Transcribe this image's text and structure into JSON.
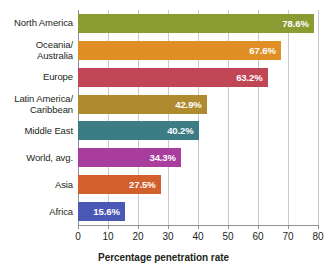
{
  "chart_data": {
    "type": "bar",
    "orientation": "horizontal",
    "title": "",
    "xlabel": "Percentage penetration rate",
    "ylabel": "",
    "xlim": [
      0,
      80
    ],
    "xticks": [
      0,
      10,
      20,
      30,
      40,
      50,
      60,
      70,
      80
    ],
    "xtick_labels": [
      "0",
      "10",
      "20",
      "30",
      "40",
      "50",
      "60",
      "70",
      "80"
    ],
    "grid": "vertical",
    "legend": "none",
    "value_label_suffix": "%",
    "categories": [
      "North America",
      "Oceania/\nAustralia",
      "Europe",
      "Latin America/\nCaribbean",
      "Middle East",
      "World, avg.",
      "Asia",
      "Africa"
    ],
    "values": [
      78.6,
      67.6,
      63.2,
      42.9,
      40.2,
      34.3,
      27.5,
      15.6
    ],
    "value_labels": [
      "78.6%",
      "67.6%",
      "63.2%",
      "42.9%",
      "40.2%",
      "34.3%",
      "27.5%",
      "15.6%"
    ],
    "colors": [
      "#8a9b32",
      "#df8f23",
      "#c04656",
      "#b08a2e",
      "#3c7d85",
      "#a93d9e",
      "#d1602c",
      "#4b58b5"
    ],
    "bars": [
      {
        "label": "North America",
        "label_lines": [
          "North America"
        ],
        "value": 78.6,
        "value_label": "78.6%",
        "color": "#8a9b32"
      },
      {
        "label": "Oceania/ Australia",
        "label_lines": [
          "Oceania/",
          "Australia"
        ],
        "value": 67.6,
        "value_label": "67.6%",
        "color": "#df8f23"
      },
      {
        "label": "Europe",
        "label_lines": [
          "Europe"
        ],
        "value": 63.2,
        "value_label": "63.2%",
        "color": "#c04656"
      },
      {
        "label": "Latin America/ Caribbean",
        "label_lines": [
          "Latin America/",
          "Caribbean"
        ],
        "value": 42.9,
        "value_label": "42.9%",
        "color": "#b08a2e"
      },
      {
        "label": "Middle East",
        "label_lines": [
          "Middle East"
        ],
        "value": 40.2,
        "value_label": "40.2%",
        "color": "#3c7d85"
      },
      {
        "label": "World, avg.",
        "label_lines": [
          "World, avg."
        ],
        "value": 34.3,
        "value_label": "34.3%",
        "color": "#a93d9e"
      },
      {
        "label": "Asia",
        "label_lines": [
          "Asia"
        ],
        "value": 27.5,
        "value_label": "27.5%",
        "color": "#d1602c"
      },
      {
        "label": "Africa",
        "label_lines": [
          "Africa"
        ],
        "value": 15.6,
        "value_label": "15.6%",
        "color": "#4b58b5"
      }
    ]
  },
  "axis": {
    "x_title": "Percentage penetration rate"
  }
}
